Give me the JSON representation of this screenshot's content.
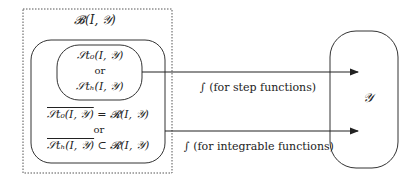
{
  "outer_set": {
    "label": "𝓑(I, 𝒴)"
  },
  "inner_top": {
    "line1": "𝒮t₀(I, 𝒴)",
    "line2": "or",
    "line3": "𝒮tₕ(I, 𝒴)"
  },
  "inner_bottom": {
    "line1_left": "𝒮t₀(I, 𝒴)",
    "line1_right": " = 𝓡(I, 𝒴)",
    "line2": "or",
    "line3_left": "𝒮tₕ(I, 𝒴)",
    "line3_right": " ⊂ 𝓡(I, 𝒴)"
  },
  "target": {
    "label": "𝒴"
  },
  "arrows": [
    {
      "label": "∫ (for step functions)"
    },
    {
      "label": "∫ (for integrable functions)"
    }
  ],
  "colors": {
    "stroke": "#333333",
    "dotted": "#555555"
  }
}
